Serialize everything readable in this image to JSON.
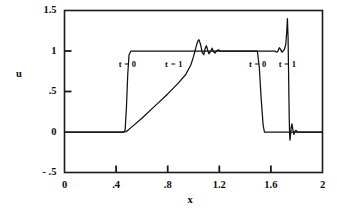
{
  "chart_data": {
    "type": "line",
    "title": "",
    "xlabel": "x",
    "ylabel": "u",
    "xlim": [
      0,
      2
    ],
    "ylim": [
      -0.5,
      1.5
    ],
    "grid": false,
    "legend": "none",
    "x_ticks": [
      {
        "value": 0,
        "label": "0"
      },
      {
        "value": 0.4,
        "label": ".4"
      },
      {
        "value": 0.8,
        "label": ".8"
      },
      {
        "value": 1.2,
        "label": "1.2"
      },
      {
        "value": 1.6,
        "label": "1.6"
      },
      {
        "value": 2.0,
        "label": "2"
      }
    ],
    "y_ticks": [
      {
        "value": 1.5,
        "label": "1.5"
      },
      {
        "value": 1.0,
        "label": "1"
      },
      {
        "value": 0.5,
        "label": ".5"
      },
      {
        "value": 0.0,
        "label": "0"
      },
      {
        "value": -0.5,
        "label": "- .5"
      }
    ],
    "annotations": [
      {
        "text": "t = 0",
        "x": 0.42,
        "y": 0.83
      },
      {
        "text": "t = 1",
        "x": 0.78,
        "y": 0.83
      },
      {
        "text": "t = 0",
        "x": 1.43,
        "y": 0.83
      },
      {
        "text": "t = 1",
        "x": 1.66,
        "y": 0.83
      }
    ],
    "series": [
      {
        "name": "t = 0",
        "description": "initial square pulse, unit amplitude from x=0.47 to x=1.52",
        "points": [
          [
            0.0,
            0.0
          ],
          [
            0.46,
            0.0
          ],
          [
            0.47,
            0.02
          ],
          [
            0.48,
            0.3
          ],
          [
            0.49,
            0.7
          ],
          [
            0.5,
            0.95
          ],
          [
            0.515,
            1.0
          ],
          [
            1.0,
            1.0
          ],
          [
            1.48,
            1.0
          ],
          [
            1.495,
            1.0
          ],
          [
            1.51,
            0.8
          ],
          [
            1.525,
            0.4
          ],
          [
            1.54,
            0.08
          ],
          [
            1.55,
            0.0
          ],
          [
            1.7,
            0.0
          ],
          [
            2.0,
            0.0
          ]
        ]
      },
      {
        "name": "t = 1",
        "description": "advected/dispersive solution: linear ramp then Gibbs oscillations to plateau 1, ending in sharp spike near x=1.73",
        "points": [
          [
            0.0,
            0.0
          ],
          [
            0.46,
            0.0
          ],
          [
            0.48,
            0.005
          ],
          [
            0.52,
            0.06
          ],
          [
            0.6,
            0.17
          ],
          [
            0.7,
            0.32
          ],
          [
            0.8,
            0.47
          ],
          [
            0.88,
            0.6
          ],
          [
            0.94,
            0.71
          ],
          [
            0.98,
            0.83
          ],
          [
            1.0,
            0.93
          ],
          [
            1.015,
            1.02
          ],
          [
            1.03,
            1.11
          ],
          [
            1.042,
            1.14
          ],
          [
            1.055,
            1.08
          ],
          [
            1.068,
            0.98
          ],
          [
            1.08,
            0.955
          ],
          [
            1.09,
            1.03
          ],
          [
            1.1,
            1.065
          ],
          [
            1.11,
            1.01
          ],
          [
            1.12,
            0.965
          ],
          [
            1.132,
            0.995
          ],
          [
            1.144,
            1.035
          ],
          [
            1.156,
            0.99
          ],
          [
            1.168,
            0.975
          ],
          [
            1.18,
            1.005
          ],
          [
            1.195,
            1.015
          ],
          [
            1.21,
            0.995
          ],
          [
            1.23,
            1.0
          ],
          [
            1.3,
            1.0
          ],
          [
            1.45,
            1.0
          ],
          [
            1.56,
            1.0
          ],
          [
            1.61,
            1.0
          ],
          [
            1.63,
            1.0
          ],
          [
            1.645,
            0.985
          ],
          [
            1.655,
            1.0
          ],
          [
            1.665,
            1.04
          ],
          [
            1.675,
            1.02
          ],
          [
            1.685,
            0.985
          ],
          [
            1.695,
            1.0
          ],
          [
            1.705,
            1.02
          ],
          [
            1.715,
            1.08
          ],
          [
            1.722,
            1.22
          ],
          [
            1.728,
            1.4
          ],
          [
            1.733,
            1.18
          ],
          [
            1.736,
            0.85
          ],
          [
            1.739,
            0.5
          ],
          [
            1.742,
            0.18
          ],
          [
            1.745,
            -0.02
          ],
          [
            1.748,
            -0.1
          ],
          [
            1.752,
            -0.04
          ],
          [
            1.757,
            0.05
          ],
          [
            1.763,
            0.1
          ],
          [
            1.77,
            0.03
          ],
          [
            1.778,
            -0.03
          ],
          [
            1.786,
            0.01
          ],
          [
            1.795,
            0.02
          ],
          [
            1.805,
            0.0
          ],
          [
            1.85,
            0.0
          ],
          [
            2.0,
            0.0
          ]
        ]
      }
    ]
  },
  "axis_titles": {
    "x": "x",
    "y": "u"
  },
  "colors": {
    "line": "#111111",
    "frame": "#1a1a1a",
    "background": "#ffffff"
  }
}
